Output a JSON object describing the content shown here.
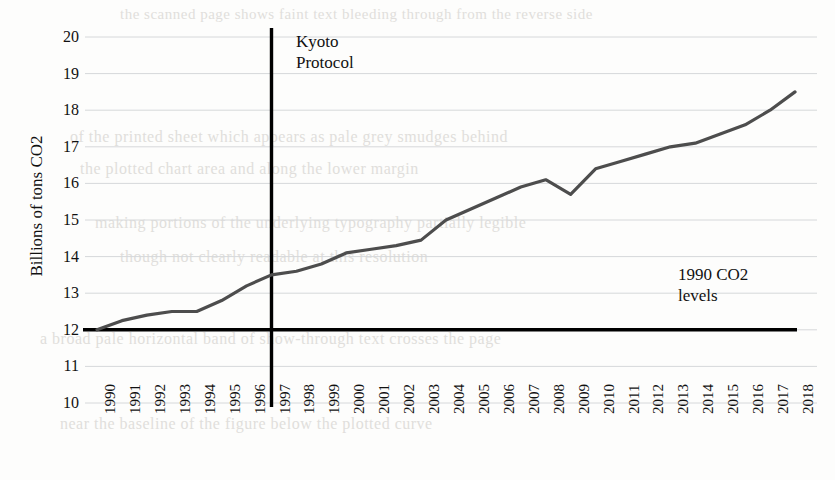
{
  "chart_data": {
    "type": "line",
    "title": "",
    "subtitle": "",
    "xlabel": "",
    "ylabel": "Billions of tons CO2",
    "xlim": [
      1990,
      2018
    ],
    "ylim": [
      10,
      20
    ],
    "ytick_labels": [
      "20",
      "19",
      "18",
      "17",
      "16",
      "15",
      "14",
      "13",
      "12",
      "11",
      "10"
    ],
    "ytick_values": [
      20,
      19,
      18,
      17,
      16,
      15,
      14,
      13,
      12,
      11,
      10
    ],
    "grid": true,
    "grid_axis": "y",
    "legend": false,
    "legend_position": "none",
    "categories": [
      "1990",
      "1991",
      "1992",
      "1993",
      "1994",
      "1995",
      "1996",
      "1997",
      "1998",
      "1999",
      "2000",
      "2001",
      "2002",
      "2003",
      "2004",
      "2005",
      "2006",
      "2007",
      "2008",
      "2009",
      "2010",
      "2011",
      "2012",
      "2013",
      "2014",
      "2015",
      "2016",
      "2017",
      "2018"
    ],
    "series": [
      {
        "name": "Global CO2 emissions",
        "color": "#4d4d4d",
        "values": [
          12.0,
          12.25,
          12.4,
          12.5,
          12.5,
          12.8,
          13.2,
          13.5,
          13.6,
          13.8,
          14.1,
          14.2,
          14.3,
          14.45,
          15.0,
          15.3,
          15.6,
          15.9,
          16.1,
          15.7,
          16.4,
          16.6,
          16.8,
          17.0,
          17.1,
          17.35,
          17.6,
          18.0,
          18.5
        ]
      }
    ],
    "reference_lines": [
      {
        "name": "1990 CO2 levels",
        "orientation": "horizontal",
        "value": 12,
        "color": "#000000",
        "label": "1990 CO2\nlevels"
      },
      {
        "name": "Kyoto Protocol",
        "orientation": "vertical",
        "value": 1997,
        "color": "#000000",
        "label": "Kyoto\nProtocol"
      }
    ],
    "annotations": [
      {
        "id": "kyoto",
        "text": "Kyoto\nProtocol",
        "at_year": 1997
      },
      {
        "id": "baseline",
        "text": "1990 CO2\nlevels",
        "at_value": 12
      }
    ]
  },
  "axes": {
    "y_title": "Billions of tons CO2"
  },
  "background_text": {
    "line1": "the scanned page shows faint text bleeding through from the reverse side",
    "line2": "of the printed sheet which appears as pale grey smudges behind",
    "line3": "the plotted chart area and along the lower margin",
    "line4": "making portions of the underlying typography partially legible",
    "line5": "though not clearly readable at this resolution",
    "line6": "a broad pale horizontal band of show-through text crosses the page",
    "line7": "near the baseline of the figure below the plotted curve"
  }
}
